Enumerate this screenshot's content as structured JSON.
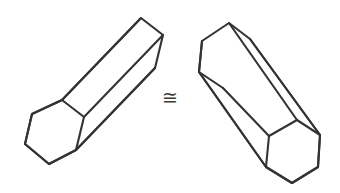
{
  "figure": {
    "background_color": "#ffffff",
    "line_color": "#333333",
    "face_color": "#ffffff",
    "line_width": 2.1,
    "canvas": {
      "width": 340,
      "height": 193
    },
    "relation": {
      "symbol": "≅",
      "name": "congruent-to",
      "label": "is congruent to",
      "color": "#3a3a3a",
      "x": 170,
      "y": 97
    },
    "shapes": [
      {
        "id": "left-prism",
        "name": "hexagonal-prism-left",
        "label": "Left hexagonal prism",
        "orientation": "axis runs from lower-left to upper-right",
        "near_hexagon_face": [
          [
            32,
            114
          ],
          [
            62,
            100
          ],
          [
            84,
            117
          ],
          [
            76,
            150
          ],
          [
            49,
            164
          ],
          [
            25,
            144
          ]
        ],
        "far_hexagon_face": [
          [
            112,
            32
          ],
          [
            141,
            18
          ],
          [
            163,
            35
          ],
          [
            155,
            68
          ],
          [
            128,
            82
          ],
          [
            104,
            62
          ]
        ],
        "silhouette": [
          [
            32,
            114
          ],
          [
            62,
            100
          ],
          [
            141,
            18
          ],
          [
            163,
            35
          ],
          [
            155,
            68
          ],
          [
            76,
            150
          ],
          [
            49,
            164
          ],
          [
            25,
            144
          ]
        ],
        "visible_long_edges": [
          [
            [
              62,
              100
            ],
            [
              141,
              18
            ]
          ],
          [
            [
              84,
              117
            ],
            [
              163,
              35
            ]
          ],
          [
            [
              76,
              150
            ],
            [
              155,
              68
            ]
          ]
        ],
        "near_face_visible_edges": [
          [
            [
              32,
              114
            ],
            [
              62,
              100
            ]
          ],
          [
            [
              62,
              100
            ],
            [
              84,
              117
            ]
          ],
          [
            [
              84,
              117
            ],
            [
              76,
              150
            ]
          ],
          [
            [
              76,
              150
            ],
            [
              49,
              164
            ]
          ],
          [
            [
              49,
              164
            ],
            [
              25,
              144
            ]
          ],
          [
            [
              25,
              144
            ],
            [
              32,
              114
            ]
          ]
        ],
        "far_face_visible_edges": [
          [
            [
              112,
              32
            ],
            [
              141,
              18
            ]
          ],
          [
            [
              141,
              18
            ],
            [
              163,
              35
            ]
          ],
          [
            [
              163,
              35
            ],
            [
              155,
              68
            ]
          ]
        ]
      },
      {
        "id": "right-prism",
        "name": "hexagonal-prism-right",
        "label": "Right hexagonal prism",
        "orientation": "axis runs from upper-left to lower-right",
        "near_hexagon_face": [
          [
            269,
            136
          ],
          [
            297,
            120
          ],
          [
            320,
            135
          ],
          [
            318,
            167
          ],
          [
            292,
            183
          ],
          [
            266,
            167
          ]
        ],
        "far_hexagon_face": [
          [
            202,
            41
          ],
          [
            229,
            23
          ],
          [
            250,
            39
          ],
          [
            249,
            72
          ],
          [
            223,
            88
          ],
          [
            199,
            72
          ]
        ],
        "silhouette": [
          [
            202,
            41
          ],
          [
            229,
            23
          ],
          [
            250,
            39
          ],
          [
            320,
            135
          ],
          [
            318,
            167
          ],
          [
            292,
            183
          ],
          [
            266,
            167
          ],
          [
            199,
            72
          ]
        ],
        "visible_long_edges": [
          [
            [
              229,
              23
            ],
            [
              297,
              120
            ]
          ],
          [
            [
              250,
              39
            ],
            [
              320,
              135
            ]
          ],
          [
            [
              199,
              72
            ],
            [
              266,
              167
            ]
          ]
        ],
        "near_face_visible_edges": [
          [
            [
              269,
              136
            ],
            [
              297,
              120
            ]
          ],
          [
            [
              297,
              120
            ],
            [
              320,
              135
            ]
          ],
          [
            [
              320,
              135
            ],
            [
              318,
              167
            ]
          ],
          [
            [
              318,
              167
            ],
            [
              292,
              183
            ]
          ],
          [
            [
              292,
              183
            ],
            [
              266,
              167
            ]
          ],
          [
            [
              266,
              167
            ],
            [
              269,
              136
            ]
          ]
        ],
        "far_face_visible_edges": [
          [
            [
              202,
              41
            ],
            [
              229,
              23
            ]
          ],
          [
            [
              229,
              23
            ],
            [
              250,
              39
            ]
          ],
          [
            [
              199,
              72
            ],
            [
              202,
              41
            ]
          ],
          [
            [
              199,
              72
            ],
            [
              223,
              88
            ]
          ]
        ]
      }
    ]
  }
}
